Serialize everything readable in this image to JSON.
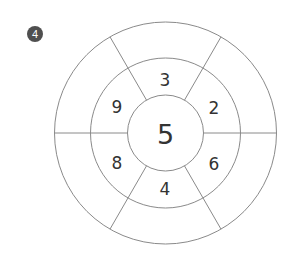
{
  "badge": {
    "label": "4",
    "color": "#4f4f4f"
  },
  "diagram": {
    "center": {
      "x": 165.5,
      "y": 133
    },
    "radii": {
      "inner": 38,
      "middle": 75,
      "outer": 111
    },
    "stroke_color": "#8a8a8a",
    "spoke_angles_deg": [
      0,
      60,
      120,
      180,
      240,
      300
    ],
    "center_value": "5",
    "middle_ring": [
      {
        "position": "top",
        "value": "3",
        "x": 165,
        "y": 80
      },
      {
        "position": "upper-right",
        "value": "2",
        "x": 214,
        "y": 108
      },
      {
        "position": "lower-right",
        "value": "6",
        "x": 214,
        "y": 164
      },
      {
        "position": "bottom",
        "value": "4",
        "x": 165,
        "y": 189
      },
      {
        "position": "lower-left",
        "value": "8",
        "x": 117,
        "y": 163
      },
      {
        "position": "upper-left",
        "value": "9",
        "x": 117,
        "y": 107
      }
    ],
    "outer_ring": [
      "",
      "",
      "",
      "",
      "",
      ""
    ]
  }
}
